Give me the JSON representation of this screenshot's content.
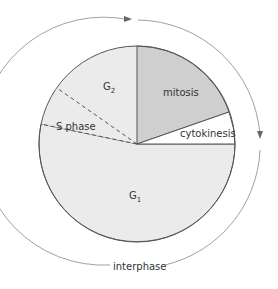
{
  "segments": [
    {
      "id": "mitosis",
      "label": "mitosis",
      "color": "#cfcfcf"
    },
    {
      "id": "cytokinesis",
      "label": "cytokinesis",
      "color": "#ffffff"
    },
    {
      "id": "g1",
      "label": "G",
      "sub": "1",
      "color": "#ebebeb"
    },
    {
      "id": "s-phase",
      "label": "S phase",
      "color": "#ebebeb"
    },
    {
      "id": "g2",
      "label": "G",
      "sub": "2",
      "color": "#ebebeb"
    }
  ],
  "outer_label": "interphase",
  "colors": {
    "stroke": "#555555",
    "arc": "#888888"
  }
}
